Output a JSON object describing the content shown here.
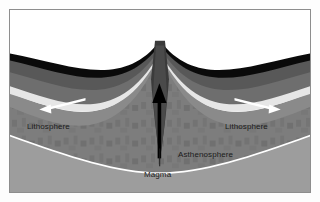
{
  "figure": {
    "kind": "geology-cross-section",
    "background_color": "#ffffff",
    "border_color": "#8d8d8d"
  },
  "labels": {
    "lithosphere_left": "Lithosphere",
    "lithosphere_right": "Lithosphere",
    "asthenosphere": "Asthenosphere",
    "magma": "Magma"
  },
  "icons": {
    "spreading_arrow_left": "arrow-left-icon",
    "spreading_arrow_right": "arrow-right-icon",
    "magma_arrow": "arrow-up-icon",
    "magma_leader": "leader-line-icon"
  },
  "arrows": {
    "left_direction": "left",
    "right_direction": "right",
    "magma_direction": "up",
    "spreading_arrow_color": "#ffffff",
    "magma_arrow_color": "#000000"
  },
  "layers": [
    {
      "name": "ocean-water",
      "color": "#ffffff"
    },
    {
      "name": "oceanic-crust",
      "color": "#0b0b0b"
    },
    {
      "name": "upper-lithosphere",
      "color": "#595959"
    },
    {
      "name": "lower-lithosphere",
      "color": "#6f6f6f"
    },
    {
      "name": "pale-boundary-band",
      "color": "#e4e4e4"
    },
    {
      "name": "upper-asthenosphere",
      "color": "#8b8b8b"
    },
    {
      "name": "deep-asthenosphere",
      "color": "#7a7a7a"
    },
    {
      "name": "mantle-floor",
      "color": "#9a9a9a"
    }
  ]
}
